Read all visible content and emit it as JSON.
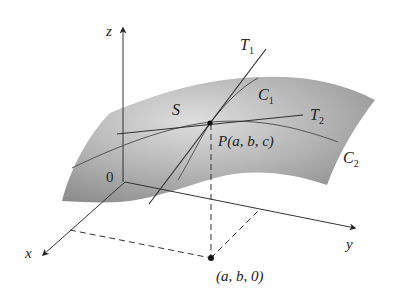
{
  "diagram": {
    "type": "3d-surface-tangent-lines",
    "labels": {
      "z_axis": "z",
      "x_axis": "x",
      "y_axis": "y",
      "origin": "0",
      "surface": "S",
      "tangent1": "T",
      "tangent1_sub": "1",
      "tangent2": "T",
      "tangent2_sub": "2",
      "curve1": "C",
      "curve1_sub": "1",
      "curve2": "C",
      "curve2_sub": "2",
      "point_p": "P(a, b, c)",
      "point_base": "(a, b, 0)"
    },
    "colors": {
      "surface_light": "#d4d4d4",
      "surface_dark": "#8a8a8a",
      "lines": "#333333"
    }
  }
}
